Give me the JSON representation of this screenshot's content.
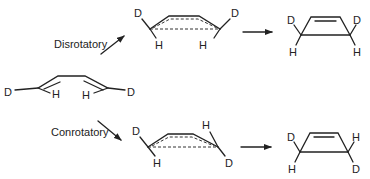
{
  "diagram": {
    "labels": {
      "disrotatory": "Disrotatory",
      "conrotatory": "Conrotatory"
    },
    "reactant": {
      "name": "(Z)-1,4-dideuterio-butadiene",
      "atoms": {
        "left_sub": "D",
        "left_h": "H",
        "right_h": "H",
        "right_sub": "D"
      }
    },
    "disrotatory_path": {
      "transition_state": {
        "left_top": "D",
        "left_bottom": "H",
        "right_top": "D",
        "right_bottom": "H"
      },
      "product": {
        "left_top": "D",
        "left_bottom": "H",
        "right_top": "D",
        "right_bottom": "H"
      }
    },
    "conrotatory_path": {
      "transition_state": {
        "left_top": "D",
        "left_bottom": "H",
        "right_top": "H",
        "right_bottom": "D"
      },
      "product": {
        "left_top": "D",
        "left_bottom": "H",
        "right_top": "H",
        "right_bottom": "D"
      }
    },
    "colors": {
      "ink": "#222222",
      "background": "#ffffff"
    }
  }
}
